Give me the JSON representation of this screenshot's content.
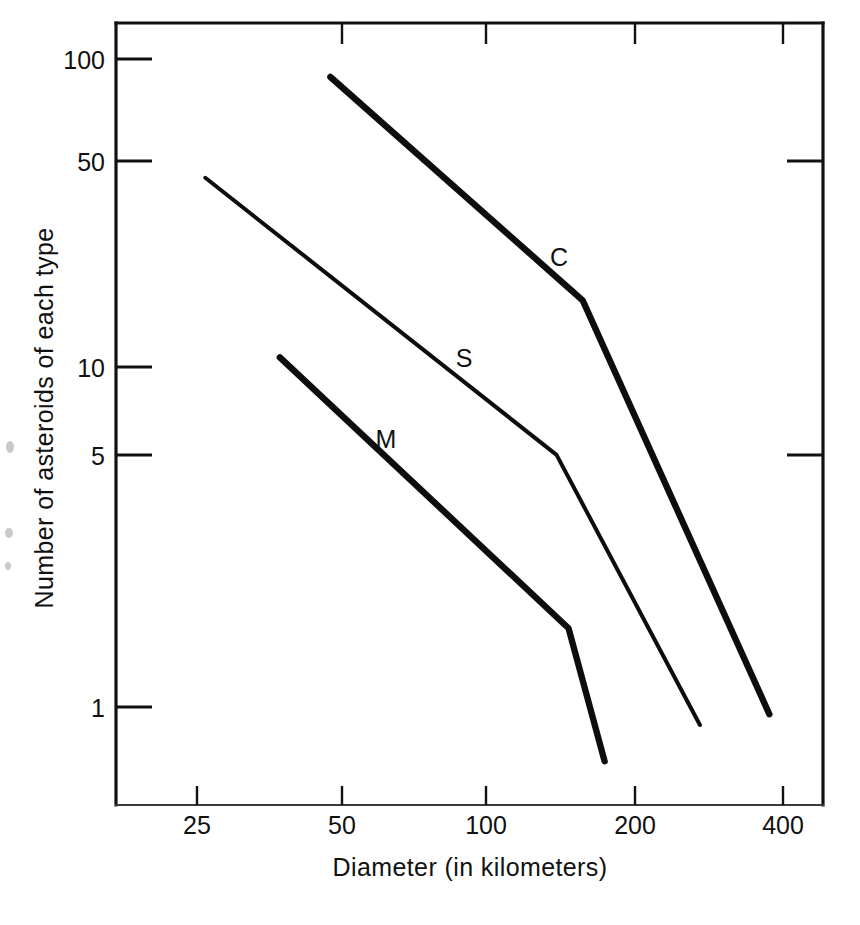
{
  "chart_data": {
    "type": "line",
    "title": "",
    "xlabel": "Diameter (in kilometers)",
    "ylabel": "Number of asteroids of each type",
    "xscale": "log",
    "yscale": "log",
    "xlim": [
      20,
      470
    ],
    "ylim": [
      0.55,
      135
    ],
    "grid": false,
    "legend": "inline-labels",
    "xticks": [
      25,
      50,
      100,
      200,
      400
    ],
    "xtick_labels": [
      "25",
      "50",
      "100",
      "200",
      "400"
    ],
    "yticks": [
      1,
      5,
      10,
      50,
      100
    ],
    "ytick_labels": [
      "1",
      "5",
      "10",
      "50",
      "100"
    ],
    "series": [
      {
        "name": "C",
        "label": "C",
        "x": [
          47,
          155,
          375
        ],
        "y": [
          88,
          18,
          0.95
        ]
      },
      {
        "name": "S",
        "label": "S",
        "x": [
          26,
          137,
          270
        ],
        "y": [
          43,
          6.0,
          0.88
        ]
      },
      {
        "name": "M",
        "label": "M",
        "x": [
          37,
          145,
          172
        ],
        "y": [
          12,
          1.75,
          0.68
        ]
      }
    ]
  },
  "axes": {
    "x_title": "Diameter (in kilometers)",
    "y_title": "Number of asteroids of each type",
    "x_tick_labels": [
      "25",
      "50",
      "100",
      "200",
      "400"
    ],
    "y_tick_labels": [
      "100",
      "50",
      "10",
      "5",
      "1"
    ]
  },
  "series_labels": {
    "c": "C",
    "s": "S",
    "m": "M"
  },
  "colors": {
    "line": "#0d0d0d",
    "axis": "#111111",
    "background": "#ffffff"
  }
}
